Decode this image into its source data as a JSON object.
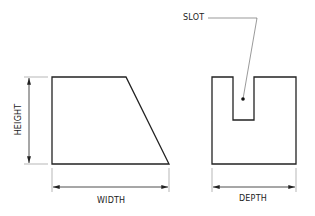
{
  "diagram": {
    "left_view": {
      "shape": "trapezoid",
      "dimensions": {
        "height_label": "HEIGHT",
        "width_label": "WIDTH"
      }
    },
    "right_view": {
      "shape": "rectangle-with-slot",
      "callout_label": "SLOT",
      "dimensions": {
        "depth_label": "DEPTH"
      }
    },
    "colors": {
      "stroke": "#222222",
      "background": "#ffffff"
    }
  }
}
